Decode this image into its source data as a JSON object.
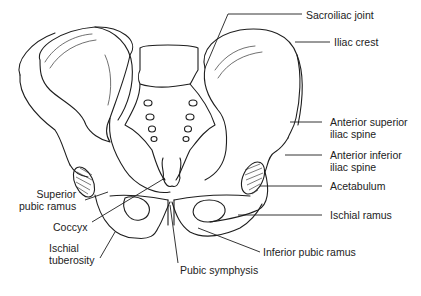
{
  "figure": {
    "labels": {
      "sacroiliac_joint": "Sacroiliac joint",
      "iliac_crest": "Iliac crest",
      "anterior_superior_iliac_spine_1": "Anterior superior",
      "anterior_superior_iliac_spine_2": "iliac spine",
      "anterior_inferior_iliac_spine_1": "Anterior inferior",
      "anterior_inferior_iliac_spine_2": "iliac spine",
      "acetabulum": "Acetabulum",
      "ischial_ramus": "Ischial ramus",
      "inferior_pubic_ramus": "Inferior pubic ramus",
      "pubic_symphysis": "Pubic symphysis",
      "ischial_tuberosity_1": "Ischial",
      "ischial_tuberosity_2": "tuberosity",
      "coccyx": "Coccyx",
      "superior_pubic_ramus_1": "Superior",
      "superior_pubic_ramus_2": "pubic ramus"
    },
    "colors": {
      "line": "#1e1e1e",
      "background": "#ffffff"
    }
  }
}
